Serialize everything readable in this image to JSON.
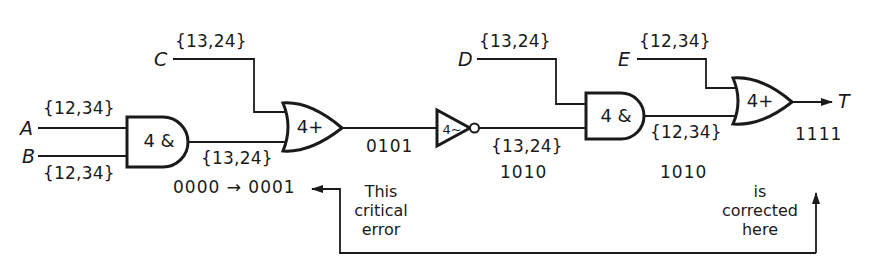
{
  "diagram": {
    "type": "logic-circuit",
    "inputs": [
      {
        "name": "A",
        "set": "{12,34}"
      },
      {
        "name": "B",
        "set": "{12,34}"
      },
      {
        "name": "C",
        "set": "{13,24}"
      },
      {
        "name": "D",
        "set": "{13,24}"
      },
      {
        "name": "E",
        "set": "{12,34}"
      }
    ],
    "gates": [
      {
        "id": "and1",
        "kind": "AND",
        "label": "4 &"
      },
      {
        "id": "or1",
        "kind": "OR",
        "label": "4+"
      },
      {
        "id": "not1",
        "kind": "NOT",
        "label": "4~"
      },
      {
        "id": "and2",
        "kind": "AND",
        "label": "4 &"
      },
      {
        "id": "or2",
        "kind": "OR",
        "label": "4+"
      }
    ],
    "wires": {
      "and1_out_set": "{13,24}",
      "and1_out_value": "0000 → 0001",
      "or1_out_value": "0101",
      "not1_out_set": "{13,24}",
      "not1_out_value": "1010",
      "and2_out_set": "{12,34}",
      "and2_out_value": "1010",
      "or2_out_value": "1111"
    },
    "output": {
      "name": "T"
    },
    "annotations": {
      "left_note": "This critical error",
      "left_note_lines": [
        "This",
        "critical",
        "error"
      ],
      "right_note": "is corrected here",
      "right_note_lines": [
        "is",
        "corrected",
        "here"
      ]
    }
  }
}
